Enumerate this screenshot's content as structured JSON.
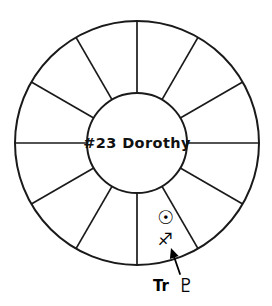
{
  "diagram": {
    "type": "astrological-house-wheel",
    "title": "#23 Dorothy",
    "center_label": "#23 Dorothy",
    "house_count": 12,
    "geometry": {
      "center_x": 137,
      "center_y": 143,
      "outer_radius": 122,
      "inner_radius": 50,
      "spoke_step_degrees": 30,
      "spoke_offset_degrees": 0
    },
    "colors": {
      "stroke": "#1a1a1a",
      "fill": "#ffffff",
      "text": "#111111",
      "glyph": "#000000"
    }
  },
  "placements": [
    {
      "id": "sun-placement",
      "glyph": "☉",
      "glyph_name": "sun-symbol",
      "x": 166,
      "y": 224
    },
    {
      "id": "sagittarius-sign",
      "glyph": "♐",
      "glyph_name": "sagittarius-symbol",
      "x": 165,
      "y": 245
    }
  ],
  "annotation": {
    "id": "transit-pluto",
    "prefix": "Tr",
    "glyph": "♇",
    "glyph_name": "pluto-symbol",
    "label_x": 161,
    "label_y": 291,
    "glyph_x": 186,
    "glyph_y": 292,
    "pointer": {
      "tip_x": 171,
      "tip_y": 248,
      "tail_x": 180,
      "tail_y": 274
    }
  }
}
